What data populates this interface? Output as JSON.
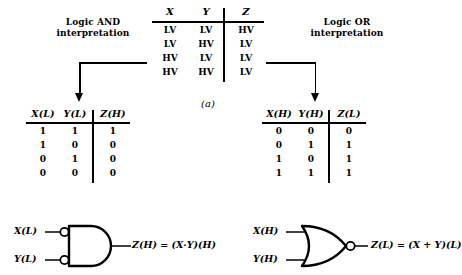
{
  "figure": {
    "caption": "(a)",
    "background": "#ffffff",
    "ink": "#000000"
  },
  "left_interpretation": {
    "line1": "Logic AND",
    "line2": "interpretation"
  },
  "right_interpretation": {
    "line1": "Logic OR",
    "line2": "interpretation"
  },
  "voltage_table": {
    "headers": [
      "X",
      "Y",
      "Z"
    ],
    "rows": [
      [
        "LV",
        "LV",
        "HV"
      ],
      [
        "LV",
        "HV",
        "LV"
      ],
      [
        "HV",
        "LV",
        "LV"
      ],
      [
        "HV",
        "HV",
        "LV"
      ]
    ]
  },
  "left_table": {
    "headers": [
      "X(L)",
      "Y(L)",
      "Z(H)"
    ],
    "rows": [
      [
        "1",
        "1",
        "1"
      ],
      [
        "1",
        "0",
        "0"
      ],
      [
        "0",
        "1",
        "0"
      ],
      [
        "0",
        "0",
        "0"
      ]
    ]
  },
  "right_table": {
    "headers": [
      "X(H)",
      "Y(H)",
      "Z(L)"
    ],
    "rows": [
      [
        "0",
        "0",
        "0"
      ],
      [
        "0",
        "1",
        "1"
      ],
      [
        "1",
        "0",
        "1"
      ],
      [
        "1",
        "1",
        "1"
      ]
    ]
  },
  "left_gate": {
    "symbol": "and-gate-active-low-inputs",
    "input_labels": [
      "X(L)",
      "Y(L)"
    ],
    "output_expression": "Z(H) = (X·Y)(H)"
  },
  "right_gate": {
    "symbol": "nor-gate",
    "input_labels": [
      "X(H)",
      "Y(H)"
    ],
    "output_expression": "Z(L) = (X + Y)(L)"
  }
}
